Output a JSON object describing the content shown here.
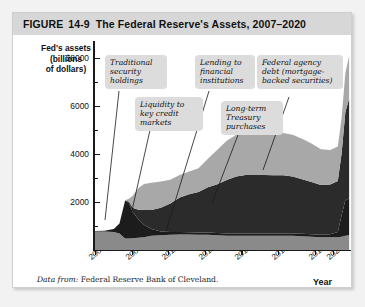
{
  "figure": {
    "label": "FIGURE",
    "number": "14-9",
    "title": "The Federal Reserve's Assets, 2007–2020"
  },
  "axis": {
    "y_title_line1": "Fed's assets",
    "y_title_line2": "(billions",
    "y_title_line3": "of dollars)",
    "y_ticks": [
      "$8000",
      "6000",
      "4000",
      "2000"
    ],
    "x_title": "Year",
    "x_ticks": [
      "2007",
      "2009",
      "2011",
      "2013",
      "2015",
      "2017",
      "2019",
      "2020"
    ]
  },
  "callouts": [
    {
      "id": "traditional",
      "text": "Traditional security holdings"
    },
    {
      "id": "liquidity",
      "text": "Liquidity to key credit markets"
    },
    {
      "id": "lending",
      "text": "Lending to financial institutions"
    },
    {
      "id": "treasury",
      "text": "Long-term Treasury purchases"
    },
    {
      "id": "agency",
      "text": "Federal agency debt (mortgage-backed securities)"
    }
  ],
  "source": {
    "prefix": "Data from:",
    "text": "Federal Reserve Bank of Cleveland."
  },
  "colors": {
    "band_traditional": "#8a8a8a",
    "band_liquidity": "#1c1c1c",
    "band_treasury": "#2b2b2b",
    "band_agency": "#a8a8a8",
    "header_bg": "#d7d7d7",
    "callout_bg": "#dcdcdc",
    "axis": "#1a1a1a"
  },
  "chart_data": {
    "type": "area",
    "title": "The Federal Reserve's Assets, 2007–2020",
    "xlabel": "Year",
    "ylabel": "Fed's assets (billions of dollars)",
    "stacked": true,
    "xlim": [
      2007,
      2020.6
    ],
    "ylim": [
      0,
      8800
    ],
    "yticks": [
      2000,
      4000,
      6000,
      8000
    ],
    "grid": false,
    "legend": "none (annotated callouts)",
    "x": [
      2007.0,
      2007.5,
      2008.0,
      2008.3,
      2008.6,
      2008.8,
      2009.0,
      2009.3,
      2009.6,
      2010.0,
      2010.5,
      2011.0,
      2011.5,
      2012.0,
      2012.5,
      2013.0,
      2013.5,
      2014.0,
      2014.5,
      2015.0,
      2015.5,
      2016.0,
      2016.5,
      2017.0,
      2017.5,
      2018.0,
      2018.5,
      2019.0,
      2019.5,
      2019.9,
      2020.1,
      2020.3,
      2020.5
    ],
    "series": [
      {
        "name": "Traditional security holdings",
        "values": [
          780,
          780,
          760,
          700,
          480,
          480,
          500,
          520,
          540,
          600,
          620,
          640,
          650,
          650,
          640,
          640,
          620,
          600,
          600,
          600,
          600,
          600,
          600,
          600,
          600,
          580,
          560,
          540,
          540,
          540,
          560,
          600,
          620
        ]
      },
      {
        "name": "Liquidity to key credit markets / Lending to financial institutions",
        "values": [
          20,
          30,
          120,
          420,
          1600,
          1500,
          1100,
          780,
          520,
          280,
          160,
          120,
          110,
          100,
          100,
          100,
          100,
          100,
          100,
          100,
          100,
          100,
          100,
          100,
          100,
          100,
          100,
          100,
          120,
          220,
          900,
          1500,
          1550
        ]
      },
      {
        "name": "Long-term Treasury purchases",
        "values": [
          0,
          0,
          0,
          0,
          0,
          60,
          180,
          400,
          620,
          800,
          1000,
          1200,
          1450,
          1600,
          1700,
          1900,
          2050,
          2250,
          2400,
          2460,
          2460,
          2460,
          2450,
          2450,
          2400,
          2300,
          2200,
          2100,
          2100,
          2150,
          2600,
          3700,
          4200
        ]
      },
      {
        "name": "Federal agency debt (mortgage-backed securities)",
        "values": [
          0,
          0,
          0,
          0,
          20,
          120,
          500,
          900,
          1100,
          1150,
          1100,
          1000,
          950,
          960,
          1000,
          1200,
          1450,
          1650,
          1750,
          1780,
          1780,
          1780,
          1780,
          1780,
          1750,
          1700,
          1620,
          1500,
          1450,
          1450,
          1500,
          1650,
          1800
        ]
      }
    ],
    "totals": [
      800,
      810,
      880,
      1120,
      2100,
      2160,
      2280,
      2600,
      2780,
      2830,
      2880,
      2960,
      3160,
      3310,
      3440,
      3840,
      4220,
      4600,
      4850,
      4940,
      4940,
      4940,
      4930,
      4930,
      4850,
      4680,
      4480,
      4240,
      4210,
      4360,
      5560,
      7450,
      8170
    ],
    "annotations": [
      {
        "text": "Traditional security holdings",
        "points_to_x": 2008.0,
        "points_to_y": 300
      },
      {
        "text": "Liquidity to key credit markets",
        "points_to_x": 2008.7,
        "points_to_y": 1300
      },
      {
        "text": "Lending to financial institutions",
        "points_to_x": 2011.0,
        "points_to_y": 700
      },
      {
        "text": "Long-term Treasury purchases",
        "points_to_x": 2014.3,
        "points_to_y": 2100
      },
      {
        "text": "Federal agency debt (mortgage-backed securities)",
        "points_to_x": 2016.6,
        "points_to_y": 4100
      }
    ]
  }
}
